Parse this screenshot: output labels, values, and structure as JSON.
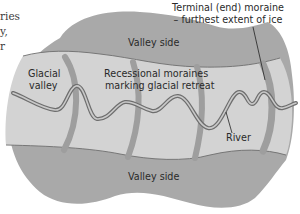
{
  "diagram": {
    "cut_text_lines": [
      "ries",
      "y,",
      "r"
    ],
    "labels": {
      "terminal_moraine_line1": "Terminal (end) moraine",
      "terminal_moraine_line2": "– furthest extent of ice",
      "valley_side_top": "Valley side",
      "valley_side_bottom": "Valley side",
      "glacial_valley_line1": "Glacial",
      "glacial_valley_line2": "valley",
      "recessional_line1": "Recessional moraines",
      "recessional_line2": "marking glacial retreat",
      "river": "River"
    },
    "colors": {
      "valley_side": "#a9a9a9",
      "valley_floor": "#d3d3d3",
      "moraine": "#9e9e9e",
      "river_outline": "#6e6e6e",
      "river_fill": "#c9c9c9",
      "text": "#2a2a2a"
    }
  }
}
